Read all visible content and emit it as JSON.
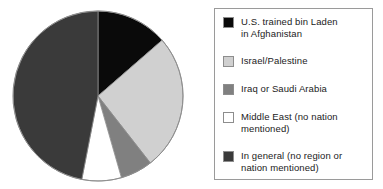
{
  "chart_data": {
    "type": "pie",
    "title": "",
    "subtitle": "",
    "xlabel": "",
    "ylabel": "",
    "legend_position": "right",
    "grid": false,
    "start_angle_deg": 0,
    "direction": "clockwise",
    "categories": [
      "U.S. trained bin Laden in Afghanistan",
      "Israel/Palestine",
      "Iraq or Saudi Arabia",
      "Middle East (no nation mentioned)",
      "In general (no region or nation mentioned)"
    ],
    "values": [
      13.6,
      25.8,
      6.1,
      7.5,
      47.0
    ],
    "value_unit": "percent",
    "slice_angles_deg": [
      49,
      93,
      22,
      27,
      169
    ],
    "slice_boundaries_deg": [
      0,
      49,
      142,
      164,
      191,
      360
    ],
    "colors": [
      "#0a0a0a",
      "#d0d0d0",
      "#808080",
      "#ffffff",
      "#3a3a3a"
    ],
    "labels_shown_on_slices": false
  },
  "legend": {
    "items": [
      {
        "label": "U.S. trained bin Laden\nin Afghanistan",
        "color": "#0a0a0a",
        "swatch_name": "legend-swatch-us-trained-bin-laden"
      },
      {
        "label": "Israel/Palestine",
        "color": "#d0d0d0",
        "swatch_name": "legend-swatch-israel-palestine"
      },
      {
        "label": "Iraq or Saudi Arabia",
        "color": "#808080",
        "swatch_name": "legend-swatch-iraq-saudi-arabia"
      },
      {
        "label": "Middle East (no nation\nmentioned)",
        "color": "#ffffff",
        "swatch_name": "legend-swatch-middle-east"
      },
      {
        "label": "In general (no region or\nnation mentioned)",
        "color": "#3a3a3a",
        "swatch_name": "legend-swatch-in-general"
      }
    ]
  },
  "style": {
    "pie_outline_color": "#8d8d8d",
    "legend_border_color": "#9a9a9a",
    "background": "#ffffff"
  }
}
